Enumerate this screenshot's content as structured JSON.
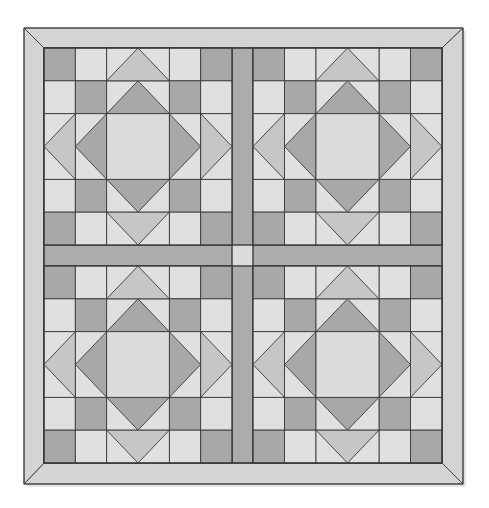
{
  "diagram": {
    "type": "quilt-pattern",
    "layout": {
      "blocks_per_row": 2,
      "blocks_per_col": 2,
      "block_grid": 6,
      "has_sashing": true,
      "has_cornerstone": true,
      "has_mitered_border": true
    },
    "geometry": {
      "outer": {
        "x0": 24,
        "y0": 28,
        "x1": 463,
        "y1": 484
      },
      "inner": {
        "x0": 44,
        "y0": 48,
        "x1": 442,
        "y1": 463
      },
      "block_cols": [
        [
          44,
          232
        ],
        [
          253,
          442
        ]
      ],
      "block_rows": [
        [
          48,
          245
        ],
        [
          266,
          463
        ]
      ]
    },
    "colors": {
      "border": "#d4d4d4",
      "sashing": "#acacac",
      "cornerstone": "#dcdcdc",
      "light": "#e0e0e0",
      "medium": "#c6c6c6",
      "dark": "#a8a8a8",
      "center": "#dcdcdc",
      "line": "#3a3a3a"
    },
    "block_pattern": {
      "description": "6x6 grid: dark corner squares, dark squares diagonally adjacent, large on-point dark diamond framing a light center square, medium triangles pointing outward at each side midpoint",
      "rows": [
        [
          "dark",
          "light",
          "tri-top",
          "tri-top",
          "light",
          "dark"
        ],
        [
          "light",
          "dark",
          "dia-top",
          "dia-top",
          "dark",
          "light"
        ],
        [
          "tri-left",
          "dia-left",
          "center",
          "center",
          "dia-right",
          "tri-right"
        ],
        [
          "tri-left",
          "dia-left",
          "center",
          "center",
          "dia-right",
          "tri-right"
        ],
        [
          "light",
          "dark",
          "dia-bottom",
          "dia-bottom",
          "dark",
          "light"
        ],
        [
          "dark",
          "light",
          "tri-bottom",
          "tri-bottom",
          "light",
          "dark"
        ]
      ]
    },
    "blocks": [
      {
        "id": "block-top-left"
      },
      {
        "id": "block-top-right"
      },
      {
        "id": "block-bottom-left"
      },
      {
        "id": "block-bottom-right"
      }
    ]
  }
}
